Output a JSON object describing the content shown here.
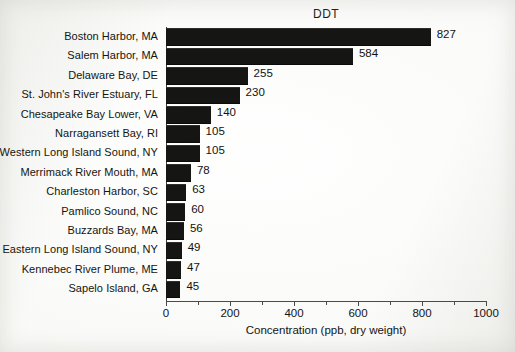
{
  "chart_data": {
    "type": "bar",
    "orientation": "horizontal",
    "title": "DDT",
    "xlabel": "Concentration (ppb, dry weight)",
    "ylabel": "",
    "xlim": [
      0,
      1000
    ],
    "grid": false,
    "legend": null,
    "tick_labels": [
      "0",
      "200",
      "400",
      "600",
      "800",
      "1000"
    ],
    "tick_values": [
      0,
      200,
      400,
      600,
      800,
      1000
    ],
    "minor_tick_values": [
      100,
      300,
      500,
      700,
      900
    ],
    "bar_color": "#151513",
    "categories": [
      "Boston Harbor, MA",
      "Salem Harbor, MA",
      "Delaware Bay, DE",
      "St. John's River Estuary, FL",
      "Chesapeake Bay Lower, VA",
      "Narragansett Bay, RI",
      "Western Long Island Sound, NY",
      "Merrimack River Mouth, MA",
      "Charleston Harbor, SC",
      "Pamlico Sound, NC",
      "Buzzards Bay, MA",
      "Eastern Long Island Sound, NY",
      "Kennebec River Plume, ME",
      "Sapelo Island, GA"
    ],
    "values": [
      827,
      584,
      255,
      230,
      140,
      105,
      105,
      78,
      63,
      60,
      56,
      49,
      47,
      45
    ],
    "value_labels": [
      "827",
      "584",
      "255",
      "230",
      "140",
      "105",
      "105",
      "78",
      "63",
      "60",
      "56",
      "49",
      "47",
      "45"
    ]
  }
}
